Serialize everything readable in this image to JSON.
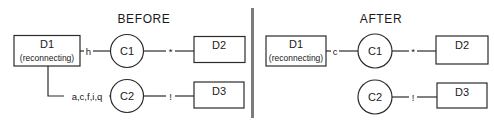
{
  "figure": {
    "title_before": "BEFORE",
    "title_after": "AFTER"
  },
  "before": {
    "title": "BEFORE",
    "nodes": {
      "d1_label": "D1",
      "d1_sublabel": "(reconnecting)",
      "c1_label": "C1",
      "c2_label": "C2",
      "d2_label": "D2",
      "d3_label": "D3"
    },
    "edge_labels": {
      "d1_to_c1": "h",
      "d1_to_c2": "a,c,f,i,q",
      "c1_to_d2": "*",
      "c2_to_d3": "!"
    }
  },
  "after": {
    "title": "AFTER",
    "nodes": {
      "d1_label": "D1",
      "d1_sublabel": "(reconnecting)",
      "c1_label": "C1",
      "c2_label": "C2",
      "d2_label": "D2",
      "d3_label": "D3"
    },
    "edge_labels": {
      "d1_to_c1": "c",
      "c1_to_d2": "*",
      "c2_to_d3": "!"
    }
  },
  "colors": {
    "stroke": "#2b2b2b",
    "divider": "#7b7b7b",
    "background": "#ffffff",
    "text": "#1a1a1a"
  }
}
